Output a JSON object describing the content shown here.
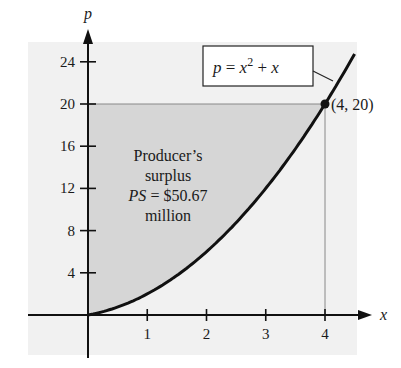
{
  "chart_data": {
    "type": "area",
    "title": "",
    "xlabel": "x",
    "ylabel": "p",
    "xlim": [
      -0.3,
      4.5
    ],
    "ylim": [
      -2,
      26
    ],
    "grid": false,
    "x_ticks": [
      1,
      2,
      3,
      4
    ],
    "y_ticks": [
      4,
      8,
      12,
      16,
      20,
      24
    ],
    "x_tick_labels": [
      "1",
      "2",
      "3",
      "4"
    ],
    "y_tick_labels": [
      "4",
      "8",
      "12",
      "16",
      "20",
      "24"
    ],
    "series": [
      {
        "name": "p = x^2 + x",
        "function": "x^2 + x",
        "x": [
          0,
          0.5,
          1,
          1.5,
          2,
          2.5,
          3,
          3.5,
          4,
          4.5
        ],
        "values": [
          0,
          0.75,
          2,
          3.75,
          6,
          8.75,
          12,
          15.75,
          20,
          24.75
        ]
      }
    ],
    "shaded_region": {
      "description": "Region between p = 20 and the curve p = x^2 + x for 0 <= x <= 4",
      "x_range": [
        0,
        4
      ],
      "upper": 20,
      "lower": "x^2 + x"
    },
    "points": [
      {
        "x": 4,
        "y": 20,
        "label": "(4, 20)"
      }
    ],
    "annotations": [
      {
        "text": "Producer's surplus PS = $50.67 million"
      },
      {
        "text": "p = x² + x",
        "boxed": true
      }
    ]
  },
  "labels": {
    "x_axis": "x",
    "y_axis": "p",
    "x_ticks": [
      "1",
      "2",
      "3",
      "4"
    ],
    "y_ticks": [
      "4",
      "8",
      "12",
      "16",
      "20",
      "24"
    ],
    "point": "(4, 20)",
    "equation_lhs": "p",
    "equation_eq": " = ",
    "equation_var": "x",
    "equation_exp": "2",
    "equation_plus": " + ",
    "equation_var2": "x",
    "surplus_line1": "Producer’s",
    "surplus_line2": "surplus",
    "surplus_ps": "PS",
    "surplus_value": " = $50.67",
    "surplus_line4": "million"
  },
  "colors": {
    "background_panel": "#f1f1f1",
    "shaded": "#d6d6d6",
    "curve": "#111111",
    "axis": "#111111",
    "guide": "#888888"
  }
}
